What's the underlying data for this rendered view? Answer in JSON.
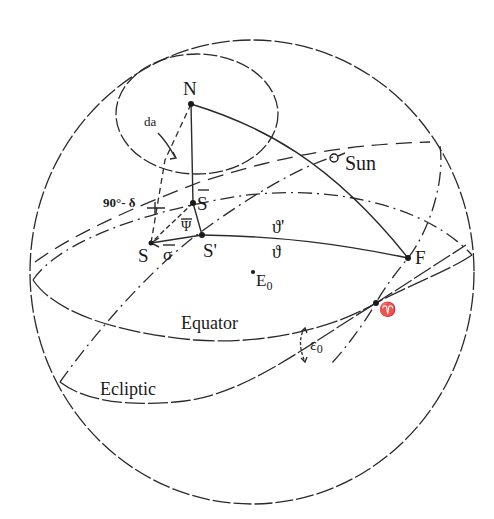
{
  "diagram": {
    "labels": {
      "north_pole": "N",
      "da": "da",
      "colatitude": "90°- δ",
      "s_bar": "S",
      "psi_bar": "Ψ",
      "sigma_bar": "σ",
      "s": "S",
      "s_prime": "S'",
      "theta_prime": "ϑ'",
      "theta": "ϑ",
      "sun": "Sun",
      "f": "F",
      "e0_base": "E",
      "e0_sub": "0",
      "equator": "Equator",
      "ecliptic": "Ecliptic",
      "epsilon_base": "ε",
      "epsilon_sub": "0",
      "vernal_equinox": "♈"
    },
    "colors": {
      "line": "#2a2a2a",
      "text": "#1a1a1a",
      "background": "#ffffff"
    }
  }
}
